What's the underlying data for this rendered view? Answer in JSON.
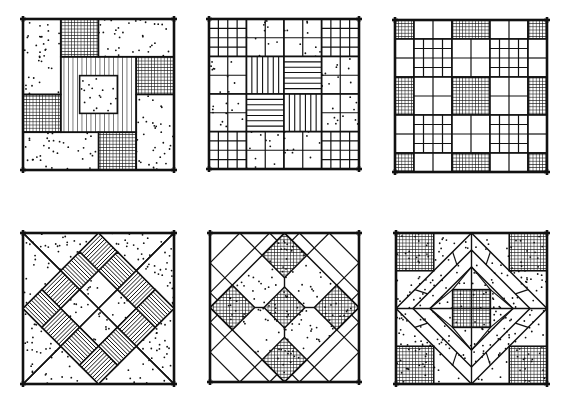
{
  "figure": {
    "title": "",
    "ink_color": "#111111",
    "paper_color": "#ffffff",
    "blocks": [
      {
        "id": "pinwheel-log-cabin",
        "x": 23,
        "y": 19,
        "size": 151,
        "units": 4,
        "shapes": [
          {
            "type": "rect",
            "x": 0,
            "y": 0,
            "w": 1,
            "h": 2,
            "fill": "dots"
          },
          {
            "type": "rect",
            "x": 1,
            "y": 0,
            "w": 1,
            "h": 1,
            "fill": "crosshatch"
          },
          {
            "type": "rect",
            "x": 2,
            "y": 0,
            "w": 2,
            "h": 1,
            "fill": "dots"
          },
          {
            "type": "rect",
            "x": 3,
            "y": 1,
            "w": 1,
            "h": 1,
            "fill": "crosshatch"
          },
          {
            "type": "rect",
            "x": 3,
            "y": 2,
            "w": 1,
            "h": 2,
            "fill": "dots"
          },
          {
            "type": "rect",
            "x": 2,
            "y": 3,
            "w": 1,
            "h": 1,
            "fill": "crosshatch"
          },
          {
            "type": "rect",
            "x": 0,
            "y": 3,
            "w": 2,
            "h": 1,
            "fill": "dots"
          },
          {
            "type": "rect",
            "x": 0,
            "y": 2,
            "w": 1,
            "h": 1,
            "fill": "crosshatch"
          },
          {
            "type": "rect",
            "x": 1,
            "y": 1,
            "w": 2,
            "h": 2,
            "fill": "vstripes"
          },
          {
            "type": "rect",
            "x": 1.5,
            "y": 1.5,
            "w": 1,
            "h": 1,
            "fill": "dots"
          }
        ]
      },
      {
        "id": "nine-patch-stripes",
        "x": 209,
        "y": 19,
        "size": 150,
        "units": 4,
        "shapes": [
          {
            "type": "rect",
            "x": 0,
            "y": 0,
            "w": 1,
            "h": 1,
            "fill": "grid4"
          },
          {
            "type": "rect",
            "x": 3,
            "y": 0,
            "w": 1,
            "h": 1,
            "fill": "grid4"
          },
          {
            "type": "rect",
            "x": 0,
            "y": 3,
            "w": 1,
            "h": 1,
            "fill": "grid4"
          },
          {
            "type": "rect",
            "x": 3,
            "y": 3,
            "w": 1,
            "h": 1,
            "fill": "grid4"
          },
          {
            "type": "rect",
            "x": 1,
            "y": 0,
            "w": 1,
            "h": 1,
            "fill": "grid2dots"
          },
          {
            "type": "rect",
            "x": 2,
            "y": 0,
            "w": 1,
            "h": 1,
            "fill": "grid2dots"
          },
          {
            "type": "rect",
            "x": 0,
            "y": 1,
            "w": 1,
            "h": 1,
            "fill": "grid2dots"
          },
          {
            "type": "rect",
            "x": 0,
            "y": 2,
            "w": 1,
            "h": 1,
            "fill": "grid2dots"
          },
          {
            "type": "rect",
            "x": 3,
            "y": 1,
            "w": 1,
            "h": 1,
            "fill": "grid2dots"
          },
          {
            "type": "rect",
            "x": 3,
            "y": 2,
            "w": 1,
            "h": 1,
            "fill": "grid2dots"
          },
          {
            "type": "rect",
            "x": 1,
            "y": 3,
            "w": 1,
            "h": 1,
            "fill": "grid2dots"
          },
          {
            "type": "rect",
            "x": 2,
            "y": 3,
            "w": 1,
            "h": 1,
            "fill": "grid2dots"
          },
          {
            "type": "rect",
            "x": 1,
            "y": 1,
            "w": 1,
            "h": 1,
            "fill": "vlines"
          },
          {
            "type": "rect",
            "x": 2,
            "y": 1,
            "w": 1,
            "h": 1,
            "fill": "hlines"
          },
          {
            "type": "rect",
            "x": 1,
            "y": 2,
            "w": 1,
            "h": 1,
            "fill": "hlines"
          },
          {
            "type": "rect",
            "x": 2,
            "y": 2,
            "w": 1,
            "h": 1,
            "fill": "vlines"
          }
        ]
      },
      {
        "id": "checkerboard-grid",
        "x": 395,
        "y": 20,
        "size": 152,
        "units": 8,
        "shapes": [
          {
            "type": "rect",
            "x": 0,
            "y": 0,
            "w": 1,
            "h": 1,
            "fill": "crosshatch"
          },
          {
            "type": "rect",
            "x": 1,
            "y": 0,
            "w": 2,
            "h": 1,
            "fill": "split2"
          },
          {
            "type": "rect",
            "x": 3,
            "y": 0,
            "w": 2,
            "h": 1,
            "fill": "crosshatch"
          },
          {
            "type": "rect",
            "x": 5,
            "y": 0,
            "w": 2,
            "h": 1,
            "fill": "split2"
          },
          {
            "type": "rect",
            "x": 7,
            "y": 0,
            "w": 1,
            "h": 1,
            "fill": "crosshatch"
          },
          {
            "type": "rect",
            "x": 0,
            "y": 1,
            "w": 1,
            "h": 2,
            "fill": "split2v"
          },
          {
            "type": "rect",
            "x": 1,
            "y": 1,
            "w": 2,
            "h": 2,
            "fill": "grid4"
          },
          {
            "type": "rect",
            "x": 3,
            "y": 1,
            "w": 2,
            "h": 2,
            "fill": "grid2"
          },
          {
            "type": "rect",
            "x": 5,
            "y": 1,
            "w": 2,
            "h": 2,
            "fill": "grid4"
          },
          {
            "type": "rect",
            "x": 7,
            "y": 1,
            "w": 1,
            "h": 2,
            "fill": "split2v"
          },
          {
            "type": "rect",
            "x": 0,
            "y": 3,
            "w": 1,
            "h": 2,
            "fill": "crosshatch"
          },
          {
            "type": "rect",
            "x": 1,
            "y": 3,
            "w": 2,
            "h": 2,
            "fill": "grid2"
          },
          {
            "type": "rect",
            "x": 3,
            "y": 3,
            "w": 2,
            "h": 2,
            "fill": "crosshatch"
          },
          {
            "type": "rect",
            "x": 5,
            "y": 3,
            "w": 2,
            "h": 2,
            "fill": "grid2"
          },
          {
            "type": "rect",
            "x": 7,
            "y": 3,
            "w": 1,
            "h": 2,
            "fill": "crosshatch"
          },
          {
            "type": "rect",
            "x": 0,
            "y": 5,
            "w": 1,
            "h": 2,
            "fill": "split2v"
          },
          {
            "type": "rect",
            "x": 1,
            "y": 5,
            "w": 2,
            "h": 2,
            "fill": "grid4"
          },
          {
            "type": "rect",
            "x": 3,
            "y": 5,
            "w": 2,
            "h": 2,
            "fill": "grid2"
          },
          {
            "type": "rect",
            "x": 5,
            "y": 5,
            "w": 2,
            "h": 2,
            "fill": "grid4"
          },
          {
            "type": "rect",
            "x": 7,
            "y": 5,
            "w": 1,
            "h": 2,
            "fill": "split2v"
          },
          {
            "type": "rect",
            "x": 0,
            "y": 7,
            "w": 1,
            "h": 1,
            "fill": "crosshatch"
          },
          {
            "type": "rect",
            "x": 1,
            "y": 7,
            "w": 2,
            "h": 1,
            "fill": "split2"
          },
          {
            "type": "rect",
            "x": 3,
            "y": 7,
            "w": 2,
            "h": 1,
            "fill": "crosshatch"
          },
          {
            "type": "rect",
            "x": 5,
            "y": 7,
            "w": 2,
            "h": 1,
            "fill": "split2"
          },
          {
            "type": "rect",
            "x": 7,
            "y": 7,
            "w": 1,
            "h": 1,
            "fill": "crosshatch"
          }
        ]
      },
      {
        "id": "diamond-in-square-stripes",
        "x": 23,
        "y": 233,
        "size": 151,
        "units": 8,
        "shapes": [
          {
            "type": "poly",
            "pts": [
              [
                0,
                0
              ],
              [
                8,
                0
              ],
              [
                4,
                4
              ]
            ],
            "fill": "dots"
          },
          {
            "type": "poly",
            "pts": [
              [
                8,
                0
              ],
              [
                8,
                8
              ],
              [
                4,
                4
              ]
            ],
            "fill": "dots"
          },
          {
            "type": "poly",
            "pts": [
              [
                8,
                8
              ],
              [
                0,
                8
              ],
              [
                4,
                4
              ]
            ],
            "fill": "dots"
          },
          {
            "type": "poly",
            "pts": [
              [
                0,
                8
              ],
              [
                0,
                0
              ],
              [
                4,
                4
              ]
            ],
            "fill": "dots"
          },
          {
            "type": "diamondgrid",
            "cx": 4,
            "cy": 4,
            "r": 4,
            "n": 4,
            "ring": "stripes",
            "inner": "dots"
          }
        ]
      },
      {
        "id": "diamonds-and-octagons",
        "x": 210,
        "y": 233,
        "size": 149,
        "units": 8,
        "shapes": [
          {
            "type": "cornerlines",
            "count": 4
          },
          {
            "type": "poly",
            "pts": [
              [
                4,
                0
              ],
              [
                8,
                4
              ],
              [
                4,
                8
              ],
              [
                0,
                4
              ]
            ],
            "fill": "dots"
          },
          {
            "type": "poly",
            "pts": [
              [
                4,
                0
              ],
              [
                5.2,
                1.2
              ],
              [
                4,
                2.4
              ],
              [
                2.8,
                1.2
              ]
            ],
            "fill": "fine"
          },
          {
            "type": "poly",
            "pts": [
              [
                8,
                4
              ],
              [
                6.8,
                5.2
              ],
              [
                5.6,
                4
              ],
              [
                6.8,
                2.8
              ]
            ],
            "fill": "fine"
          },
          {
            "type": "poly",
            "pts": [
              [
                4,
                8
              ],
              [
                2.8,
                6.8
              ],
              [
                4,
                5.6
              ],
              [
                5.2,
                6.8
              ]
            ],
            "fill": "fine"
          },
          {
            "type": "poly",
            "pts": [
              [
                0,
                4
              ],
              [
                1.2,
                2.8
              ],
              [
                2.4,
                4
              ],
              [
                1.2,
                5.2
              ]
            ],
            "fill": "fine"
          },
          {
            "type": "poly",
            "pts": [
              [
                4,
                2.9
              ],
              [
                5.1,
                4
              ],
              [
                4,
                5.1
              ],
              [
                2.9,
                4
              ]
            ],
            "fill": "fine"
          },
          {
            "type": "line",
            "pts": [
              [
                4,
                2.4
              ],
              [
                4,
                2.9
              ]
            ]
          },
          {
            "type": "line",
            "pts": [
              [
                4,
                5.1
              ],
              [
                4,
                5.6
              ]
            ]
          },
          {
            "type": "line",
            "pts": [
              [
                2.4,
                4
              ],
              [
                2.9,
                4
              ]
            ]
          },
          {
            "type": "line",
            "pts": [
              [
                5.1,
                4
              ],
              [
                5.6,
                4
              ]
            ]
          }
        ]
      },
      {
        "id": "square-in-diamond-star",
        "x": 396,
        "y": 233,
        "size": 151,
        "units": 8,
        "shapes": [
          {
            "type": "rect",
            "x": 0,
            "y": 0,
            "w": 8,
            "h": 8,
            "fill": "dots"
          },
          {
            "type": "rect",
            "x": 0,
            "y": 0,
            "w": 2,
            "h": 2,
            "fill": "crosshatch"
          },
          {
            "type": "rect",
            "x": 6,
            "y": 0,
            "w": 2,
            "h": 2,
            "fill": "crosshatch"
          },
          {
            "type": "rect",
            "x": 0,
            "y": 6,
            "w": 2,
            "h": 2,
            "fill": "crosshatch"
          },
          {
            "type": "rect",
            "x": 6,
            "y": 6,
            "w": 2,
            "h": 2,
            "fill": "crosshatch"
          },
          {
            "type": "poly",
            "pts": [
              [
                4,
                0
              ],
              [
                8,
                4
              ],
              [
                4,
                8
              ],
              [
                0,
                4
              ]
            ],
            "fill": "none"
          },
          {
            "type": "poly",
            "pts": [
              [
                4,
                0.9
              ],
              [
                7.1,
                4
              ],
              [
                4,
                7.1
              ],
              [
                0.9,
                4
              ]
            ],
            "fill": "none"
          },
          {
            "type": "poly",
            "pts": [
              [
                4,
                1.8
              ],
              [
                6.2,
                4
              ],
              [
                4,
                6.2
              ],
              [
                1.8,
                4
              ]
            ],
            "fill": "dots"
          },
          {
            "type": "line",
            "pts": [
              [
                4,
                0
              ],
              [
                4,
                8
              ]
            ]
          },
          {
            "type": "line",
            "pts": [
              [
                0,
                4
              ],
              [
                8,
                4
              ]
            ]
          },
          {
            "type": "rect",
            "x": 3,
            "y": 3,
            "w": 2,
            "h": 2,
            "fill": "crosshatch"
          },
          {
            "type": "bandticks"
          }
        ]
      }
    ]
  }
}
